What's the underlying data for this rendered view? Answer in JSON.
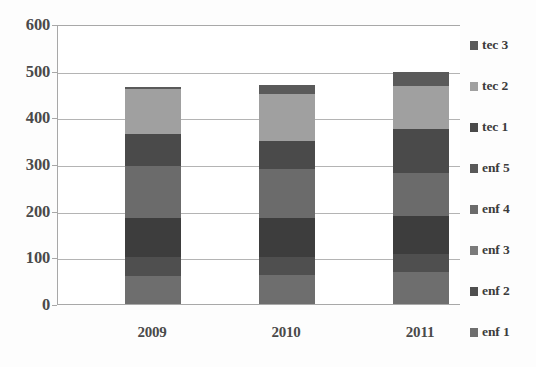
{
  "chart_data": {
    "type": "bar",
    "subtype": "stacked-bar",
    "title": "",
    "subtitle": "",
    "xlabel": "",
    "ylabel": "",
    "categories": [
      "2009",
      "2010",
      "2011"
    ],
    "ylim": [
      0,
      600
    ],
    "ytick_labels": [
      "0",
      "100",
      "200",
      "300",
      "400",
      "500",
      "600"
    ],
    "ytick_values": [
      0,
      100,
      200,
      300,
      400,
      500,
      600
    ],
    "grid": true,
    "grid_axis": "y",
    "legend_position": "right",
    "legend_order_top_to_bottom": [
      "tec 3",
      "tec 2",
      "tec 1",
      "enf 5",
      "enf 4",
      "enf 3",
      "enf 2",
      "enf 1"
    ],
    "stack_order_bottom_to_top": [
      "enf 1",
      "enf 2",
      "enf 3",
      "enf 4",
      "enf 5",
      "tec 1",
      "tec 2",
      "tec 3"
    ],
    "series": [
      {
        "name": "enf 1",
        "color": "#6e6e6e",
        "values": [
          60,
          62,
          68
        ]
      },
      {
        "name": "enf 2",
        "color": "#4f4f4f",
        "values": [
          40,
          38,
          40
        ]
      },
      {
        "name": "enf 3",
        "color": "#3d3d3d",
        "values": [
          85,
          85,
          80
        ]
      },
      {
        "name": "enf 4",
        "color": "#6b6b6b",
        "values": [
          110,
          105,
          92
        ]
      },
      {
        "name": "enf 5",
        "color": "#4a4a4a",
        "values": [
          35,
          30,
          48
        ]
      },
      {
        "name": "tec 1",
        "color": "#4a4a4a",
        "values": [
          35,
          30,
          47
        ]
      },
      {
        "name": "tec 2",
        "color": "#a0a0a0",
        "values": [
          95,
          100,
          92
        ]
      },
      {
        "name": "tec 3",
        "color": "#5a5a5a",
        "values": [
          5,
          20,
          30
        ]
      }
    ],
    "totals": [
      465,
      470,
      497
    ]
  },
  "legend": {
    "items": [
      {
        "label": "tec 3",
        "color": "#5a5a5a"
      },
      {
        "label": "tec 2",
        "color": "#a0a0a0"
      },
      {
        "label": "tec 1",
        "color": "#4a4a4a"
      },
      {
        "label": "enf 5",
        "color": "#595959"
      },
      {
        "label": "enf 4",
        "color": "#6b6b6b"
      },
      {
        "label": "enf 3",
        "color": "#7a7a7a"
      },
      {
        "label": "enf 2",
        "color": "#4f4f4f"
      },
      {
        "label": "enf 1",
        "color": "#6e6e6e"
      }
    ]
  },
  "colors": {
    "axis": "#a8a8a8",
    "gridline": "#b4b4b4",
    "tick_text": "#4a4a4a",
    "legend_text": "#3c3c3c",
    "plot_background": "#ffffff",
    "page_background": "#fdfdfd"
  }
}
